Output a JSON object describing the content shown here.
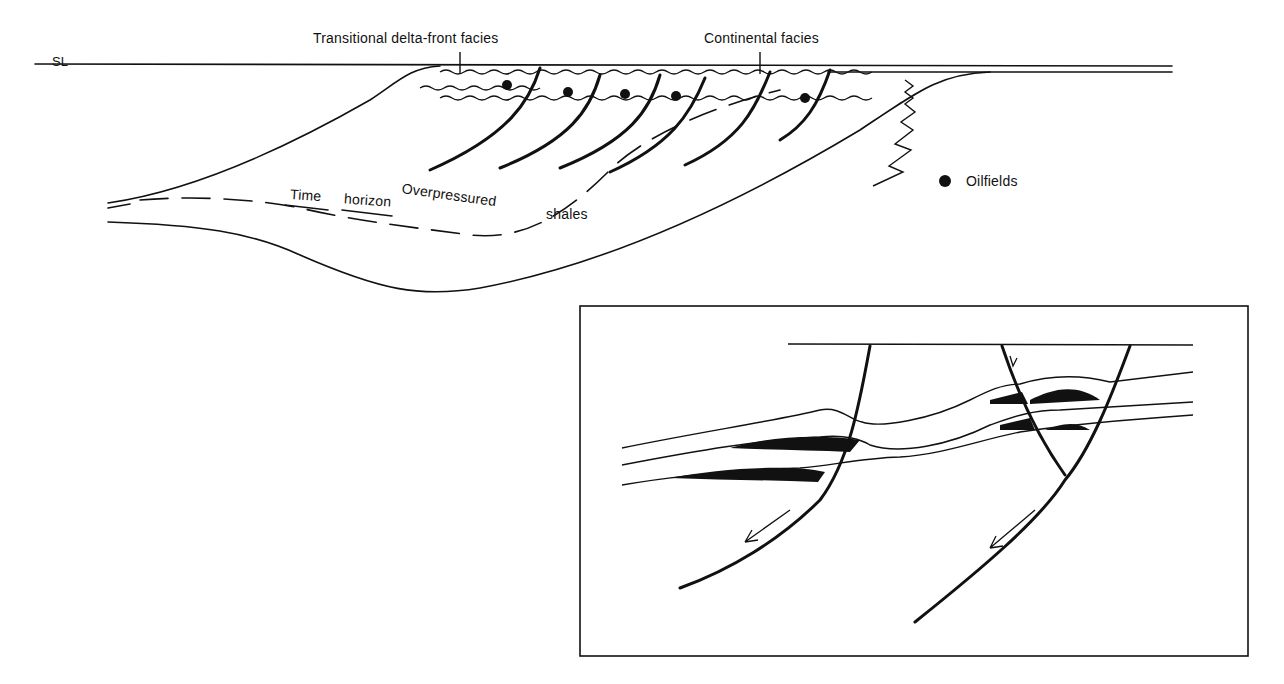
{
  "labels": {
    "sea_level": "SL",
    "transitional": "Transitional delta-front facies",
    "continental": "Continental facies",
    "overpressured": "Overpressured",
    "shales": "shales",
    "time": "Time",
    "horizon": "horizon",
    "legend_oilfields": "Oilfields"
  },
  "colors": {
    "ink": "#111111",
    "background": "#ffffff"
  }
}
